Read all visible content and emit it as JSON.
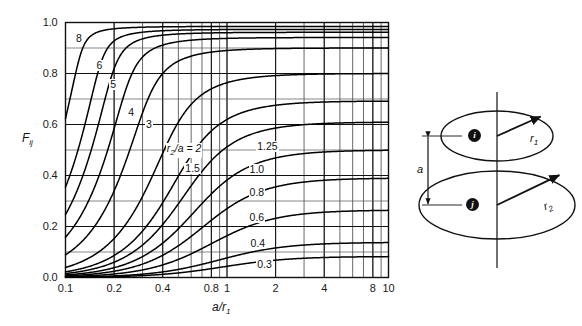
{
  "figure": {
    "kind": "view-factor-chart",
    "background": "#ffffff"
  },
  "chart_data": {
    "type": "line",
    "title": "",
    "xlabel": "a/r1",
    "ylabel": "Fij",
    "xscale": "log",
    "yscale": "linear",
    "xlim": [
      0.1,
      10
    ],
    "ylim": [
      0.0,
      1.0
    ],
    "grid": true,
    "grid_minor": true,
    "legend_position": "inline-curve-labels",
    "xticks": [
      0.1,
      0.2,
      0.4,
      0.8,
      1,
      2,
      4,
      8,
      10
    ],
    "xticklabels": [
      "0.1",
      "0.2",
      "0.4",
      "0.8",
      "1",
      "2",
      "4",
      "8",
      "10"
    ],
    "yticks": [
      0.0,
      0.2,
      0.4,
      0.6,
      0.8,
      1.0
    ],
    "yticklabels": [
      "0.0",
      "0.2",
      "0.4",
      "0.6",
      "0.8",
      "1.0"
    ],
    "yticks_minor": [
      0.1,
      0.3,
      0.5,
      0.7,
      0.9
    ],
    "parameter_name": "r2/a",
    "series": [
      {
        "name": "8",
        "r2_over_a": 8.0
      },
      {
        "name": "6",
        "r2_over_a": 6.0
      },
      {
        "name": "5",
        "r2_over_a": 5.0
      },
      {
        "name": "4",
        "r2_over_a": 4.0
      },
      {
        "name": "3",
        "r2_over_a": 3.0
      },
      {
        "name": "2",
        "r2_over_a": 2.0
      },
      {
        "name": "1.5",
        "r2_over_a": 1.5
      },
      {
        "name": "1.25",
        "r2_over_a": 1.25
      },
      {
        "name": "1.0",
        "r2_over_a": 1.0
      },
      {
        "name": "0.8",
        "r2_over_a": 0.8
      },
      {
        "name": "0.6",
        "r2_over_a": 0.6
      },
      {
        "name": "0.4",
        "r2_over_a": 0.4
      },
      {
        "name": "0.3",
        "r2_over_a": 0.3
      }
    ],
    "annotations": [
      {
        "text": "8",
        "x": 0.118,
        "y": 0.935
      },
      {
        "text": "6",
        "x": 0.158,
        "y": 0.83
      },
      {
        "text": "5",
        "x": 0.192,
        "y": 0.755
      },
      {
        "text": "4",
        "x": 0.248,
        "y": 0.645
      },
      {
        "text": "3",
        "x": 0.32,
        "y": 0.6
      },
      {
        "text": "1.5",
        "x": 0.56,
        "y": 0.425
      },
      {
        "text": "1.25",
        "x": 1.56,
        "y": 0.51
      },
      {
        "text": "1.0",
        "x": 1.4,
        "y": 0.42
      },
      {
        "text": "0.8",
        "x": 1.4,
        "y": 0.33
      },
      {
        "text": "0.6",
        "x": 1.4,
        "y": 0.235
      },
      {
        "text": "0.4",
        "x": 1.42,
        "y": 0.132
      },
      {
        "text": "0.3",
        "x": 1.56,
        "y": 0.05
      }
    ],
    "key_annotation": {
      "text": "r2/a = 2",
      "x": 0.43,
      "y": 0.505
    }
  },
  "axis": {
    "y_label_main": "F",
    "y_label_sub": "ij",
    "x_label_main": "a/r",
    "x_label_sub": "1"
  },
  "diagram": {
    "name": "coaxial-parallel-disks",
    "upper_disk_label": "i",
    "lower_disk_label": "j",
    "upper_radius_label": "r",
    "upper_radius_sub": "1",
    "lower_radius_label": "r",
    "lower_radius_sub": "2",
    "separation_label": "a"
  }
}
